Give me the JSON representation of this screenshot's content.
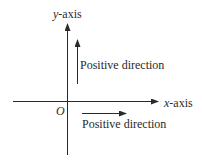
{
  "diagram": {
    "y_axis": {
      "label_var": "y",
      "label_suffix": "-axis"
    },
    "x_axis": {
      "label_var": "x",
      "label_suffix": "-axis"
    },
    "origin": {
      "label": "O"
    },
    "positive_direction_y": {
      "label": "Positive direction"
    },
    "positive_direction_x": {
      "label": "Positive direction"
    },
    "colors": {
      "stroke": "#2a2a2a",
      "background": "#ffffff"
    }
  }
}
